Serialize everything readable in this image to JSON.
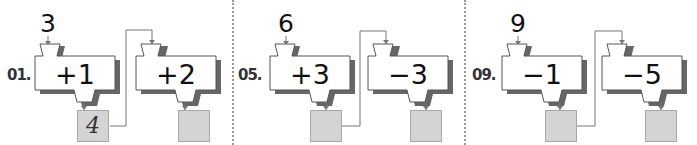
{
  "worksheet": {
    "colors": {
      "machine_fill": "#ffffff",
      "machine_stroke": "#555555",
      "machine_shadow": "#666666",
      "output_box_fill": "#d4d4d4",
      "wire": "#777777",
      "divider": "#9a9a9a"
    },
    "problems": [
      {
        "label": "01.",
        "start": "3",
        "machines": [
          {
            "operation": "+1",
            "output": "4"
          },
          {
            "operation": "+2",
            "output": ""
          }
        ]
      },
      {
        "label": "05.",
        "start": "6",
        "machines": [
          {
            "operation": "+3",
            "output": ""
          },
          {
            "operation": "−3",
            "output": ""
          }
        ]
      },
      {
        "label": "09.",
        "start": "9",
        "machines": [
          {
            "operation": "−1",
            "output": ""
          },
          {
            "operation": "−5",
            "output": ""
          }
        ]
      }
    ]
  }
}
